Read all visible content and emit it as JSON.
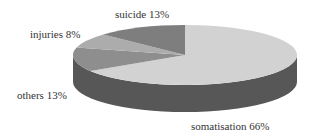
{
  "chart_data": {
    "type": "pie",
    "style": "3d",
    "title": "",
    "categories": [
      "somatisation",
      "others",
      "injuries",
      "suicide"
    ],
    "values": [
      66,
      13,
      8,
      13
    ],
    "unit": "%",
    "labels": [
      "somatisation 66%",
      "others 13%",
      "injuries 8%",
      "suicide 13%"
    ],
    "colors": [
      "#d2d2d2",
      "#8e8e8e",
      "#acacac",
      "#7e7e7e"
    ],
    "side_color": "#575757",
    "start_angle": "12 o'clock",
    "direction": "clockwise",
    "legend": "none (labels placed beside slices)"
  },
  "labels": {
    "suicide": "suicide 13%",
    "injuries": "injuries 8%",
    "others": "others 13%",
    "somatisation": "somatisation 66%"
  }
}
